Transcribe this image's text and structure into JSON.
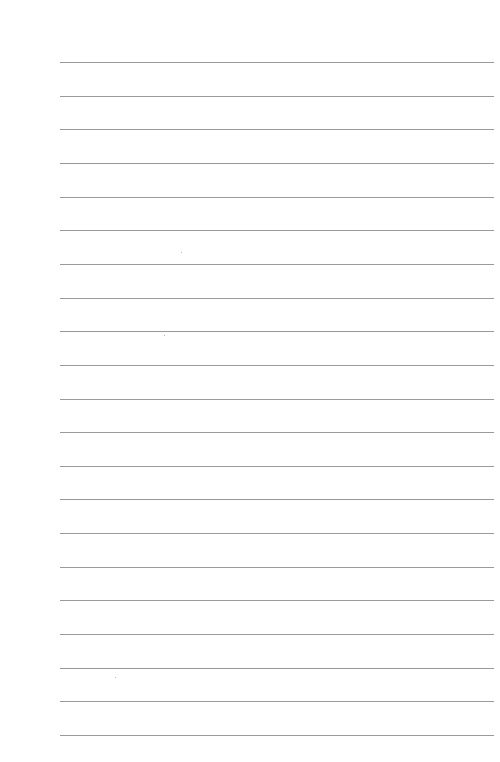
{
  "page": {
    "type": "lined-paper",
    "background_color": "#ffffff",
    "line_color": "#9a9a9a",
    "line_count": 21,
    "first_line_y": 62,
    "line_spacing": 33.65,
    "line_left": 60,
    "line_right": 494
  }
}
